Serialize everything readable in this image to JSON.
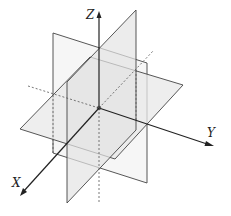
{
  "diagram": {
    "axes": {
      "x_label": "X",
      "y_label": "Y",
      "z_label": "Z"
    },
    "colors": {
      "line": "#333333",
      "plane_fill": "#ececec",
      "background": "#ffffff"
    }
  }
}
